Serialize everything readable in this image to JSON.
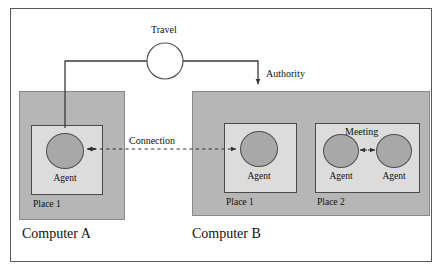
{
  "diagram": {
    "title_visible": false,
    "frame": {
      "label": "diagram-frame"
    },
    "computers": [
      {
        "id": "A",
        "label": "Computer A"
      },
      {
        "id": "B",
        "label": "Computer B"
      }
    ],
    "places": [
      {
        "computer": "A",
        "label": "Place 1"
      },
      {
        "computer": "B",
        "label": "Place 1"
      },
      {
        "computer": "B",
        "label": "Place 2"
      }
    ],
    "agents": [
      {
        "id": "a1",
        "label": "Agent",
        "place": "A/Place 1"
      },
      {
        "id": "b1",
        "label": "Agent",
        "place": "B/Place 1"
      },
      {
        "id": "b2",
        "label": "Agent",
        "place": "B/Place 2"
      },
      {
        "id": "b3",
        "label": "Agent",
        "place": "B/Place 2"
      }
    ],
    "edges": [
      {
        "id": "travel",
        "label": "Travel",
        "kind": "solid-with-node"
      },
      {
        "id": "authority",
        "label": "Authority",
        "kind": "solid-arrow"
      },
      {
        "id": "connection",
        "label": "Connection",
        "kind": "dashed-double-arrow"
      },
      {
        "id": "meeting",
        "label": "Meeting",
        "kind": "double-arrow"
      }
    ],
    "colors": {
      "frame_border": "#5a5a5a",
      "computer_fill": "#b6b6b6",
      "place_fill": "#dcdcdc",
      "agent_fill": "#a8a8a8",
      "line": "#3a3a3a",
      "text": "#111111"
    }
  }
}
